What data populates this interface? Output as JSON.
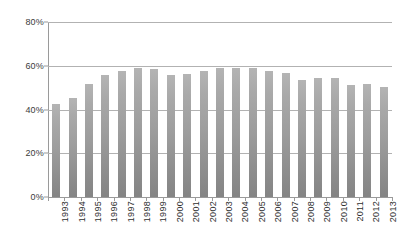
{
  "chart_data": {
    "type": "bar",
    "title": "",
    "subtitle": "",
    "xlabel": "",
    "ylabel": "",
    "ylim": [
      0,
      80
    ],
    "yticks": [
      0,
      20,
      40,
      60,
      80
    ],
    "ytick_labels": [
      "0%",
      "20%",
      "40%",
      "60%",
      "80%"
    ],
    "grid": true,
    "legend": false,
    "legend_position": "none",
    "bar_color": "#a0a0a0",
    "gridline_color": "#b2b2b2",
    "axis_color": "#9a9a9a",
    "background": "#ffffff",
    "categories": [
      "1993",
      "1994",
      "1995",
      "1996",
      "1997",
      "1998",
      "1999",
      "2000",
      "2001",
      "2002",
      "2003",
      "2004",
      "2005",
      "2006",
      "2007",
      "2008",
      "2009",
      "2010",
      "2011",
      "2012",
      "2013"
    ],
    "values": [
      42.3,
      45.1,
      51.8,
      55.7,
      57.8,
      58.8,
      58.3,
      55.6,
      56.1,
      57.8,
      58.8,
      58.8,
      58.8,
      57.4,
      56.6,
      53.6,
      54.6,
      54.5,
      51.0,
      51.7,
      50.5
    ],
    "value_labels": [
      "42%",
      "45%",
      "52%",
      "56%",
      "58%",
      "59%",
      "58%",
      "56%",
      "56%",
      "58%",
      "59%",
      "59%",
      "59%",
      "57%",
      "57%",
      "54%",
      "55%",
      "55%",
      "51%",
      "52%",
      "51%"
    ]
  }
}
